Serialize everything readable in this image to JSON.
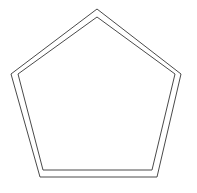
{
  "figure": {
    "canvas": {
      "width": 197,
      "height": 193,
      "background_color": "#ffffff"
    },
    "stroke_color": "#4a4a4a",
    "stroke_width": 1,
    "fill": "none",
    "shape_count": 2,
    "shapes": [
      {
        "name": "outer-pentagon",
        "sides": 5,
        "orientation": "apex-up",
        "points": "97,9 181,74 157,177 40,177 11,74",
        "vertices": [
          {
            "label": "apex",
            "x": 97,
            "y": 9
          },
          {
            "label": "right",
            "x": 181,
            "y": 74
          },
          {
            "label": "bottom-right",
            "x": 157,
            "y": 177
          },
          {
            "label": "bottom-left",
            "x": 40,
            "y": 177
          },
          {
            "label": "left",
            "x": 11,
            "y": 74
          }
        ]
      },
      {
        "name": "inner-pentagon",
        "sides": 5,
        "orientation": "apex-up",
        "points": "97,17 175,74 152,170 43,170 18,74",
        "vertices": [
          {
            "label": "apex",
            "x": 97,
            "y": 17
          },
          {
            "label": "right",
            "x": 175,
            "y": 74
          },
          {
            "label": "bottom-right",
            "x": 152,
            "y": 170
          },
          {
            "label": "bottom-left",
            "x": 43,
            "y": 170
          },
          {
            "label": "left",
            "x": 18,
            "y": 74
          }
        ]
      }
    ]
  }
}
